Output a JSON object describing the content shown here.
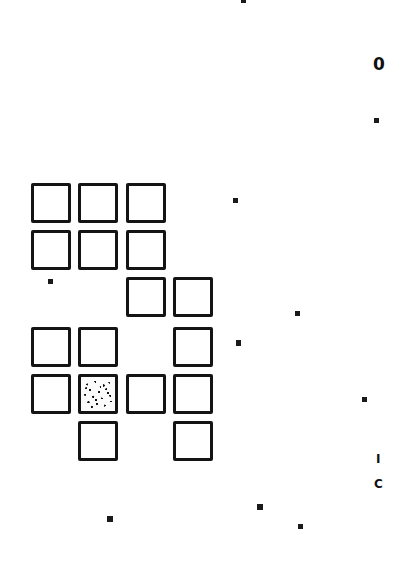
{
  "document": {
    "kind": "scanned-grid-sheet",
    "background_color": "#ffffff",
    "ink_color": "#141414",
    "width": 405,
    "height": 569
  },
  "grid": {
    "name": "hand-drawn-square-grid",
    "cell_size": 40,
    "border_width": 3,
    "origin_x": 31,
    "origin_y": 183,
    "col_step": 47,
    "row_step": 47,
    "rows": 6,
    "cols": 4,
    "filled_label": "noise-filled",
    "empty_label": "empty",
    "occupancy": [
      [
        1,
        1,
        1,
        0
      ],
      [
        1,
        1,
        1,
        0
      ],
      [
        0,
        0,
        1,
        1
      ],
      [
        1,
        1,
        0,
        1
      ],
      [
        1,
        1,
        1,
        1
      ],
      [
        0,
        1,
        0,
        1
      ]
    ],
    "noisy_cell": {
      "row": 4,
      "col": 1
    },
    "cells": [
      {
        "name": "cell-r0-c0",
        "x": 31,
        "y": 183,
        "w": 40,
        "h": 40,
        "state": "empty"
      },
      {
        "name": "cell-r0-c1",
        "x": 78,
        "y": 183,
        "w": 40,
        "h": 40,
        "state": "empty"
      },
      {
        "name": "cell-r0-c2",
        "x": 126,
        "y": 183,
        "w": 40,
        "h": 40,
        "state": "empty"
      },
      {
        "name": "cell-r1-c0",
        "x": 31,
        "y": 230,
        "w": 40,
        "h": 40,
        "state": "empty"
      },
      {
        "name": "cell-r1-c1",
        "x": 78,
        "y": 230,
        "w": 40,
        "h": 40,
        "state": "empty"
      },
      {
        "name": "cell-r1-c2",
        "x": 126,
        "y": 230,
        "w": 40,
        "h": 40,
        "state": "empty"
      },
      {
        "name": "cell-r2-c2",
        "x": 126,
        "y": 277,
        "w": 40,
        "h": 40,
        "state": "empty"
      },
      {
        "name": "cell-r2-c3",
        "x": 173,
        "y": 277,
        "w": 40,
        "h": 40,
        "state": "empty"
      },
      {
        "name": "cell-r3-c0",
        "x": 31,
        "y": 327,
        "w": 40,
        "h": 40,
        "state": "empty"
      },
      {
        "name": "cell-r3-c1",
        "x": 78,
        "y": 327,
        "w": 40,
        "h": 40,
        "state": "empty"
      },
      {
        "name": "cell-r3-c3",
        "x": 173,
        "y": 327,
        "w": 40,
        "h": 40,
        "state": "empty"
      },
      {
        "name": "cell-r4-c0",
        "x": 31,
        "y": 374,
        "w": 40,
        "h": 40,
        "state": "empty"
      },
      {
        "name": "cell-r4-c1",
        "x": 78,
        "y": 374,
        "w": 40,
        "h": 40,
        "state": "noise-filled"
      },
      {
        "name": "cell-r4-c2",
        "x": 126,
        "y": 374,
        "w": 40,
        "h": 40,
        "state": "empty"
      },
      {
        "name": "cell-r4-c3",
        "x": 173,
        "y": 374,
        "w": 40,
        "h": 40,
        "state": "empty"
      },
      {
        "name": "cell-r5-c1",
        "x": 78,
        "y": 421,
        "w": 40,
        "h": 40,
        "state": "empty"
      },
      {
        "name": "cell-r5-c3",
        "x": 173,
        "y": 421,
        "w": 40,
        "h": 40,
        "state": "empty"
      }
    ]
  },
  "artifacts": {
    "name": "scan-specks",
    "specks": [
      {
        "name": "speck-top-center",
        "x": 241,
        "y": 0,
        "w": 5,
        "h": 3
      },
      {
        "name": "speck-right-upper",
        "x": 374,
        "y": 118,
        "w": 5,
        "h": 5
      },
      {
        "name": "speck-mid-right-a",
        "x": 233,
        "y": 198,
        "w": 5,
        "h": 5
      },
      {
        "name": "speck-left-grid",
        "x": 48,
        "y": 279,
        "w": 5,
        "h": 5
      },
      {
        "name": "speck-mid-right-b",
        "x": 295,
        "y": 311,
        "w": 5,
        "h": 5
      },
      {
        "name": "speck-mid-right-c",
        "x": 236,
        "y": 340,
        "w": 5,
        "h": 6
      },
      {
        "name": "speck-right-lower",
        "x": 362,
        "y": 397,
        "w": 5,
        "h": 5
      },
      {
        "name": "speck-bottom-left",
        "x": 107,
        "y": 516,
        "w": 6,
        "h": 6
      },
      {
        "name": "speck-bottom-mid",
        "x": 257,
        "y": 504,
        "w": 6,
        "h": 6
      },
      {
        "name": "speck-bottom-right",
        "x": 298,
        "y": 524,
        "w": 5,
        "h": 5
      }
    ]
  },
  "margin_marks": {
    "name": "marginal-glyphs",
    "items": [
      {
        "name": "margin-glyph-zero",
        "text": "0",
        "x": 373,
        "y": 56,
        "size": 17
      },
      {
        "name": "margin-glyph-bar",
        "text": "I",
        "x": 376,
        "y": 453,
        "size": 12
      },
      {
        "name": "margin-glyph-c",
        "text": "C",
        "x": 374,
        "y": 478,
        "size": 12
      }
    ]
  }
}
